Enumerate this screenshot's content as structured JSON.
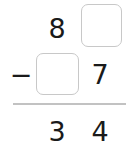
{
  "problem": {
    "type": "vertical-subtraction",
    "minuend": {
      "tens": "8",
      "ones": ""
    },
    "operator": "−",
    "subtrahend": {
      "tens": "",
      "ones": "7"
    },
    "result": {
      "tens": "3",
      "ones": "4"
    }
  },
  "colors": {
    "digit": "#1a1a1a",
    "box_border": "#c8c8c8",
    "rule": "#c2c2c2",
    "background": "#ffffff"
  }
}
